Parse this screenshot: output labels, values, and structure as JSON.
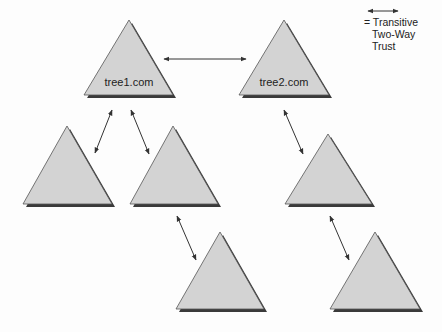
{
  "diagram": {
    "title": "",
    "trees": [
      {
        "id": "t1",
        "label": "tree1.com",
        "apex": [
          129,
          20
        ],
        "base_left": [
          84,
          95
        ],
        "base_right": [
          173,
          95
        ]
      },
      {
        "id": "t2",
        "label": "tree2.com",
        "apex": [
          284,
          20
        ],
        "base_left": [
          239,
          95
        ],
        "base_right": [
          329,
          95
        ]
      },
      {
        "id": "c1",
        "label": "",
        "apex": [
          67,
          126
        ],
        "base_left": [
          23,
          204
        ],
        "base_right": [
          112,
          204
        ]
      },
      {
        "id": "c2",
        "label": "",
        "apex": [
          173,
          126
        ],
        "base_left": [
          130,
          204
        ],
        "base_right": [
          218,
          204
        ]
      },
      {
        "id": "c3",
        "label": "",
        "apex": [
          328,
          134
        ],
        "base_left": [
          285,
          204
        ],
        "base_right": [
          372,
          204
        ]
      },
      {
        "id": "c4",
        "label": "",
        "apex": [
          220,
          232
        ],
        "base_left": [
          176,
          309
        ],
        "base_right": [
          264,
          309
        ]
      },
      {
        "id": "c5",
        "label": "",
        "apex": [
          375,
          232
        ],
        "base_left": [
          330,
          309
        ],
        "base_right": [
          420,
          309
        ]
      }
    ],
    "trusts": [
      {
        "from": "t1",
        "to": "t2",
        "x1": 164,
        "y1": 59,
        "x2": 246,
        "y2": 59
      },
      {
        "from": "t1",
        "to": "c1",
        "x1": 112,
        "y1": 110,
        "x2": 95,
        "y2": 153
      },
      {
        "from": "t1",
        "to": "c2",
        "x1": 131,
        "y1": 110,
        "x2": 149,
        "y2": 154
      },
      {
        "from": "t2",
        "to": "c3",
        "x1": 284,
        "y1": 110,
        "x2": 303,
        "y2": 154
      },
      {
        "from": "c2",
        "to": "c4",
        "x1": 177,
        "y1": 216,
        "x2": 196,
        "y2": 260
      },
      {
        "from": "c3",
        "to": "c5",
        "x1": 330,
        "y1": 216,
        "x2": 349,
        "y2": 260
      }
    ],
    "legend": {
      "x1": 368,
      "y1": 11,
      "x2": 398,
      "y2": 11,
      "lines": [
        "= Transitive",
        "Two-Way",
        "Trust"
      ]
    },
    "colors": {
      "fill": "#d3d3d3",
      "shadow": "#3a3a3a",
      "stroke": "#555555",
      "arrow": "#333333"
    }
  }
}
